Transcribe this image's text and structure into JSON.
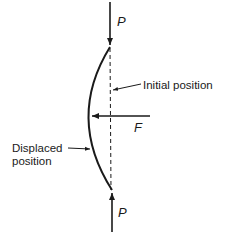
{
  "diagram": {
    "labels": {
      "top_force": "P",
      "bottom_force": "P",
      "lateral_force": "F",
      "initial_position": "Initial position",
      "displaced_position_line1": "Displaced",
      "displaced_position_line2": "position"
    },
    "colors": {
      "stroke": "#1a1a1a",
      "background": "#ffffff"
    }
  }
}
